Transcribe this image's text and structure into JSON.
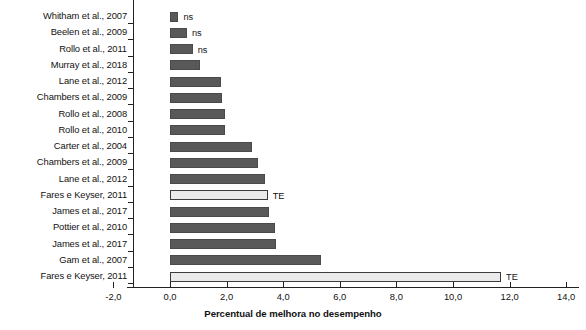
{
  "chart_data": {
    "type": "bar",
    "orientation": "horizontal",
    "title": "",
    "subtitle": "",
    "xlabel": "Percentual de melhora no desempenho",
    "ylabel": "",
    "xlim": [
      -2.0,
      14.0
    ],
    "xticks": [
      -2.0,
      0.0,
      2.0,
      4.0,
      6.0,
      8.0,
      10.0,
      12.0,
      14.0
    ],
    "xtick_labels": [
      "-2,0",
      "0,0",
      "2,0",
      "4,0",
      "6,0",
      "8,0",
      "10,0",
      "12,0",
      "14,0"
    ],
    "grid": false,
    "legend": null,
    "decimal_separator": ",",
    "colors": {
      "bar_solid_fill": "#595959",
      "bar_solid_border": "#4a4a4a",
      "bar_hollow_fill": "#ebebeb",
      "bar_hollow_border": "#3c3c3c",
      "axis": "#222222",
      "text": "#121212",
      "background": "#ffffff"
    },
    "categories": [
      "Whitham et al., 2007",
      "Beelen et al., 2009",
      "Rollo et al., 2011",
      "Murray et al., 2018",
      "Lane et al., 2012",
      "Chambers et al., 2009",
      "Rollo et al., 2008",
      "Rollo et al., 2010",
      "Carter et al., 2004",
      "Chambers et al., 2009",
      "Lane et al., 2012",
      "Fares e Keyser, 2011",
      "James et al., 2017",
      "Pottier et al., 2010",
      "James et al., 2017",
      "Gam et al., 2007",
      "Fares e Keyser, 2011"
    ],
    "values": [
      0.3,
      0.6,
      0.8,
      1.05,
      1.8,
      1.85,
      1.95,
      1.95,
      2.9,
      3.1,
      3.35,
      3.45,
      3.5,
      3.7,
      3.75,
      5.35,
      11.7
    ],
    "annotations": [
      "ns",
      "ns",
      "ns",
      "",
      "",
      "",
      "",
      "",
      "",
      "",
      "",
      "TE",
      "",
      "",
      "",
      "",
      "TE"
    ],
    "bar_styles": [
      "solid",
      "solid",
      "solid",
      "solid",
      "solid",
      "solid",
      "solid",
      "solid",
      "solid",
      "solid",
      "solid",
      "hollow",
      "solid",
      "solid",
      "solid",
      "solid",
      "hollow"
    ]
  }
}
